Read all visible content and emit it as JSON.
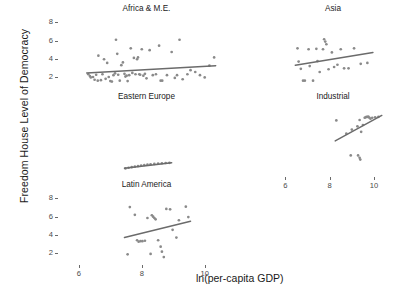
{
  "figure": {
    "ylabel": "Freedom House Level of Democracy",
    "xlabel": "ln(per-capita GDP)",
    "top_title_fragment": ""
  },
  "axes": {
    "ytick_labels": [
      "2",
      "4",
      "6",
      "8"
    ],
    "xtick_labels": [
      "6",
      "8",
      "10"
    ],
    "ytick_values": [
      2,
      4,
      6,
      8
    ],
    "xtick_values": [
      6,
      8,
      10
    ]
  },
  "panels": [
    {
      "title": "Africa & M.E."
    },
    {
      "title": "Asia"
    },
    {
      "title": "Eastern Europe"
    },
    {
      "title": "Industrial"
    },
    {
      "title": "Latin America"
    }
  ],
  "chart_data": {
    "type": "scatter",
    "title": "",
    "xlabel": "ln(per-capita GDP)",
    "ylabel": "Freedom House Level of Democracy",
    "xlim": [
      5.4,
      10.9
    ],
    "ylim": [
      0.9,
      8.6
    ],
    "grid": false,
    "legend": "none",
    "layout": "2x3 trellis (conditioned on region)",
    "point_color": "#8a8a8a",
    "line_color": "#6b6b6b",
    "panels": [
      {
        "name": "Africa & M.E.",
        "row": 0,
        "col": 0,
        "xtick_labels": [
          "6",
          "8",
          "10"
        ],
        "ytick_labels": [
          "2",
          "4",
          "6",
          "8"
        ],
        "fit": {
          "x": [
            6.25,
            10.35
          ],
          "y": [
            2.45,
            3.25
          ]
        },
        "points": [
          {
            "x": 6.3,
            "y": 2.3
          },
          {
            "x": 6.35,
            "y": 2.1
          },
          {
            "x": 6.38,
            "y": 1.95
          },
          {
            "x": 6.45,
            "y": 2.0
          },
          {
            "x": 6.5,
            "y": 1.7
          },
          {
            "x": 6.55,
            "y": 2.25
          },
          {
            "x": 6.6,
            "y": 1.6
          },
          {
            "x": 6.62,
            "y": 4.35
          },
          {
            "x": 6.7,
            "y": 1.65
          },
          {
            "x": 6.75,
            "y": 2.3
          },
          {
            "x": 6.8,
            "y": 3.95
          },
          {
            "x": 6.85,
            "y": 1.8
          },
          {
            "x": 6.9,
            "y": 3.55
          },
          {
            "x": 6.95,
            "y": 2.0
          },
          {
            "x": 7.0,
            "y": 1.55
          },
          {
            "x": 7.05,
            "y": 1.5
          },
          {
            "x": 7.1,
            "y": 2.2
          },
          {
            "x": 7.15,
            "y": 2.4
          },
          {
            "x": 7.18,
            "y": 6.1
          },
          {
            "x": 7.22,
            "y": 4.55
          },
          {
            "x": 7.25,
            "y": 2.25
          },
          {
            "x": 7.3,
            "y": 1.6
          },
          {
            "x": 7.35,
            "y": 3.3
          },
          {
            "x": 7.4,
            "y": 3.6
          },
          {
            "x": 7.45,
            "y": 2.35
          },
          {
            "x": 7.48,
            "y": 2.05
          },
          {
            "x": 7.52,
            "y": 2.15
          },
          {
            "x": 7.55,
            "y": 1.55
          },
          {
            "x": 7.6,
            "y": 2.2
          },
          {
            "x": 7.65,
            "y": 5.15
          },
          {
            "x": 7.7,
            "y": 2.45
          },
          {
            "x": 7.75,
            "y": 4.1
          },
          {
            "x": 7.8,
            "y": 2.3
          },
          {
            "x": 7.85,
            "y": 3.95
          },
          {
            "x": 7.88,
            "y": 4.15
          },
          {
            "x": 7.92,
            "y": 2.3
          },
          {
            "x": 7.95,
            "y": 2.25
          },
          {
            "x": 8.0,
            "y": 5.05
          },
          {
            "x": 8.05,
            "y": 2.15
          },
          {
            "x": 8.1,
            "y": 2.35
          },
          {
            "x": 8.15,
            "y": 1.85
          },
          {
            "x": 8.25,
            "y": 4.95
          },
          {
            "x": 8.35,
            "y": 2.2
          },
          {
            "x": 8.45,
            "y": 2.3
          },
          {
            "x": 8.55,
            "y": 5.45
          },
          {
            "x": 8.6,
            "y": 1.6
          },
          {
            "x": 8.65,
            "y": 1.6
          },
          {
            "x": 8.8,
            "y": 2.2
          },
          {
            "x": 8.95,
            "y": 4.75
          },
          {
            "x": 9.05,
            "y": 1.9
          },
          {
            "x": 9.12,
            "y": 2.2
          },
          {
            "x": 9.2,
            "y": 6.1
          },
          {
            "x": 9.3,
            "y": 1.75
          },
          {
            "x": 9.45,
            "y": 2.3
          },
          {
            "x": 9.55,
            "y": 2.75
          },
          {
            "x": 9.7,
            "y": 2.55
          },
          {
            "x": 9.85,
            "y": 2.2
          },
          {
            "x": 10.0,
            "y": 1.95
          },
          {
            "x": 10.15,
            "y": 3.25
          },
          {
            "x": 10.3,
            "y": 4.15
          }
        ]
      },
      {
        "name": "Asia",
        "row": 0,
        "col": 1,
        "xtick_labels": [
          "6",
          "8",
          "10"
        ],
        "fit": {
          "x": [
            6.45,
            9.95
          ],
          "y": [
            3.3,
            4.7
          ]
        },
        "points": [
          {
            "x": 6.55,
            "y": 5.15
          },
          {
            "x": 6.6,
            "y": 3.7
          },
          {
            "x": 6.7,
            "y": 2.9
          },
          {
            "x": 6.8,
            "y": 1.6
          },
          {
            "x": 6.88,
            "y": 1.6
          },
          {
            "x": 7.05,
            "y": 5.05
          },
          {
            "x": 7.1,
            "y": 3.2
          },
          {
            "x": 7.25,
            "y": 1.6
          },
          {
            "x": 7.4,
            "y": 5.1
          },
          {
            "x": 7.45,
            "y": 3.75
          },
          {
            "x": 7.55,
            "y": 2.55
          },
          {
            "x": 7.7,
            "y": 5.05
          },
          {
            "x": 7.75,
            "y": 6.15
          },
          {
            "x": 7.8,
            "y": 5.9
          },
          {
            "x": 7.85,
            "y": 5.6
          },
          {
            "x": 7.95,
            "y": 2.85
          },
          {
            "x": 8.1,
            "y": 4.7
          },
          {
            "x": 8.2,
            "y": 3.1
          },
          {
            "x": 8.35,
            "y": 3.35
          },
          {
            "x": 8.5,
            "y": 5.05
          },
          {
            "x": 8.65,
            "y": 2.95
          },
          {
            "x": 8.85,
            "y": 2.95
          },
          {
            "x": 9.1,
            "y": 5.15
          },
          {
            "x": 9.4,
            "y": 3.45
          },
          {
            "x": 9.7,
            "y": 3.55
          }
        ]
      },
      {
        "name": "Eastern Europe",
        "row": 1,
        "col": 0,
        "fit": {
          "x": [
            7.45,
            8.95
          ],
          "y": [
            1.65,
            2.25
          ]
        },
        "points": [
          {
            "x": 7.48,
            "y": 1.62
          },
          {
            "x": 7.58,
            "y": 1.7
          },
          {
            "x": 7.68,
            "y": 1.76
          },
          {
            "x": 7.78,
            "y": 1.82
          },
          {
            "x": 7.88,
            "y": 1.88
          },
          {
            "x": 7.98,
            "y": 1.94
          },
          {
            "x": 8.08,
            "y": 2.0
          },
          {
            "x": 8.18,
            "y": 2.04
          },
          {
            "x": 8.28,
            "y": 2.08
          },
          {
            "x": 8.4,
            "y": 2.12
          },
          {
            "x": 8.52,
            "y": 2.16
          },
          {
            "x": 8.64,
            "y": 2.19
          },
          {
            "x": 8.76,
            "y": 2.22
          },
          {
            "x": 8.88,
            "y": 2.24
          }
        ]
      },
      {
        "name": "Industrial",
        "row": 1,
        "col": 1,
        "xtick_labels": [
          "6",
          "8",
          "10"
        ],
        "fit": {
          "x": [
            8.25,
            10.35
          ],
          "y": [
            4.65,
            7.45
          ]
        },
        "points": [
          {
            "x": 8.3,
            "y": 6.9
          },
          {
            "x": 8.75,
            "y": 5.45
          },
          {
            "x": 9.0,
            "y": 5.9
          },
          {
            "x": 9.25,
            "y": 6.25
          },
          {
            "x": 9.35,
            "y": 6.95
          },
          {
            "x": 9.42,
            "y": 5.65
          },
          {
            "x": 9.5,
            "y": 6.4
          },
          {
            "x": 9.58,
            "y": 7.2
          },
          {
            "x": 9.62,
            "y": 7.25
          },
          {
            "x": 9.66,
            "y": 7.3
          },
          {
            "x": 9.7,
            "y": 7.28
          },
          {
            "x": 9.74,
            "y": 7.32
          },
          {
            "x": 9.78,
            "y": 7.22
          },
          {
            "x": 9.84,
            "y": 7.1
          },
          {
            "x": 9.92,
            "y": 7.2
          },
          {
            "x": 10.05,
            "y": 7.25
          },
          {
            "x": 10.2,
            "y": 7.3
          },
          {
            "x": 8.95,
            "y": 3.05
          },
          {
            "x": 9.28,
            "y": 3.05
          },
          {
            "x": 9.35,
            "y": 2.8
          },
          {
            "x": 9.38,
            "y": 2.6
          }
        ]
      },
      {
        "name": "Latin America",
        "row": 2,
        "col": 0,
        "xtick_labels": [
          "6",
          "8",
          "10"
        ],
        "ytick_labels": [
          "2",
          "4",
          "6",
          "8"
        ],
        "fit": {
          "x": [
            7.45,
            9.55
          ],
          "y": [
            3.7,
            5.5
          ]
        },
        "points": [
          {
            "x": 7.55,
            "y": 1.85
          },
          {
            "x": 7.62,
            "y": 7.05
          },
          {
            "x": 7.78,
            "y": 6.2
          },
          {
            "x": 7.85,
            "y": 3.4
          },
          {
            "x": 7.9,
            "y": 3.25
          },
          {
            "x": 7.96,
            "y": 3.3
          },
          {
            "x": 8.02,
            "y": 3.3
          },
          {
            "x": 8.1,
            "y": 3.35
          },
          {
            "x": 8.18,
            "y": 5.85
          },
          {
            "x": 8.28,
            "y": 1.9
          },
          {
            "x": 8.32,
            "y": 6.15
          },
          {
            "x": 8.36,
            "y": 6.0
          },
          {
            "x": 8.4,
            "y": 5.85
          },
          {
            "x": 8.44,
            "y": 5.7
          },
          {
            "x": 8.52,
            "y": 3.4
          },
          {
            "x": 8.6,
            "y": 2.7
          },
          {
            "x": 8.64,
            "y": 2.15
          },
          {
            "x": 8.7,
            "y": 1.55
          },
          {
            "x": 8.78,
            "y": 6.85
          },
          {
            "x": 8.9,
            "y": 6.8
          },
          {
            "x": 8.98,
            "y": 4.55
          },
          {
            "x": 9.1,
            "y": 3.7
          },
          {
            "x": 9.18,
            "y": 5.6
          },
          {
            "x": 9.4,
            "y": 7.1
          },
          {
            "x": 9.48,
            "y": 5.95
          }
        ]
      }
    ]
  }
}
